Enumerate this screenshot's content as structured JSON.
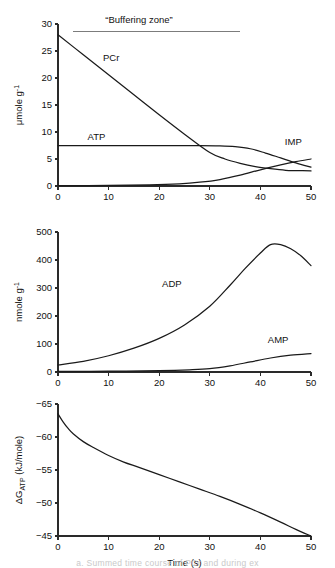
{
  "figure": {
    "xlabel": "Time (s)",
    "caption_partial": "a.  Summed time course of PCr and during ex"
  },
  "chart_data": [
    {
      "type": "line",
      "panel": "top",
      "title": "",
      "xlabel": "",
      "ylabel": "μmole g",
      "ylabel_sup": "-1",
      "xlim": [
        0,
        50
      ],
      "ylim": [
        0,
        30
      ],
      "xticks": [
        0,
        10,
        20,
        30,
        40,
        50
      ],
      "yticks": [
        0,
        5,
        10,
        15,
        20,
        25,
        30
      ],
      "grid": false,
      "legend": "inline-labels",
      "annotations": [
        {
          "text": "“Buffering zone”",
          "x": 16,
          "y": 30.2,
          "line_x0": 3,
          "line_x1": 36,
          "line_y": 28.6
        }
      ],
      "series": [
        {
          "name": "PCr",
          "label_x": 10.5,
          "label_y": 23.2,
          "x": [
            0,
            5,
            10,
            15,
            20,
            25,
            30,
            33,
            36,
            39,
            42,
            45,
            47,
            50
          ],
          "values": [
            28.0,
            24.3,
            20.6,
            16.9,
            13.2,
            9.6,
            6.2,
            5.0,
            4.2,
            3.6,
            3.2,
            2.9,
            2.85,
            2.8
          ]
        },
        {
          "name": "ATP",
          "label_x": 7.6,
          "label_y": 8.6,
          "x": [
            0,
            10,
            20,
            28,
            32,
            35,
            38,
            41,
            44,
            47,
            50
          ],
          "values": [
            7.5,
            7.5,
            7.5,
            7.5,
            7.45,
            7.3,
            6.9,
            6.1,
            5.2,
            4.3,
            3.5
          ]
        },
        {
          "name": "IMP",
          "label_x": 46.5,
          "label_y": 7.6,
          "x": [
            0,
            10,
            18,
            24,
            28,
            32,
            36,
            40,
            44,
            47,
            50
          ],
          "values": [
            0.05,
            0.1,
            0.2,
            0.4,
            0.7,
            1.2,
            2.0,
            3.0,
            3.9,
            4.5,
            5.0
          ]
        }
      ]
    },
    {
      "type": "line",
      "panel": "middle",
      "title": "",
      "xlabel": "",
      "ylabel": "nmole g",
      "ylabel_sup": "-1",
      "xlim": [
        0,
        50
      ],
      "ylim": [
        0,
        500
      ],
      "xticks": [
        0,
        10,
        20,
        30,
        40,
        50
      ],
      "yticks": [
        0,
        100,
        200,
        300,
        400,
        500
      ],
      "grid": false,
      "legend": "inline-labels",
      "annotations": [],
      "series": [
        {
          "name": "ADP",
          "label_x": 22.5,
          "label_y": 305,
          "x": [
            0,
            5,
            10,
            15,
            20,
            25,
            30,
            34,
            37,
            40,
            42,
            44,
            46,
            48,
            50
          ],
          "values": [
            25,
            38,
            58,
            85,
            120,
            168,
            235,
            310,
            370,
            425,
            455,
            455,
            440,
            415,
            380
          ]
        },
        {
          "name": "AMP",
          "label_x": 43.5,
          "label_y": 105,
          "x": [
            0,
            10,
            20,
            26,
            30,
            34,
            38,
            42,
            46,
            50
          ],
          "values": [
            2,
            3,
            5,
            8,
            12,
            22,
            36,
            50,
            60,
            66
          ]
        }
      ]
    },
    {
      "type": "line",
      "panel": "bottom",
      "title": "",
      "xlabel": "Time (s)",
      "ylabel": "ΔG",
      "ylabel_sub": "ATP",
      "ylabel_unit": " (kJ/mole)",
      "xlim": [
        0,
        50
      ],
      "ylim": [
        -65,
        -45
      ],
      "yaxis_inverted": true,
      "xticks": [
        0,
        10,
        20,
        30,
        40,
        50
      ],
      "yticks": [
        -65,
        -60,
        -55,
        -50,
        -45
      ],
      "grid": false,
      "legend": "none",
      "annotations": [],
      "series": [
        {
          "name": "dG_ATP",
          "label_x": null,
          "label_y": null,
          "x": [
            0,
            1,
            2,
            3,
            5,
            7,
            10,
            13,
            16,
            20,
            24,
            28,
            32,
            36,
            40,
            44,
            47,
            50
          ],
          "values": [
            -63.5,
            -62.3,
            -61.3,
            -60.5,
            -59.3,
            -58.4,
            -57.2,
            -56.2,
            -55.4,
            -54.3,
            -53.2,
            -52.1,
            -51.0,
            -49.8,
            -48.5,
            -47.1,
            -46.0,
            -45.0
          ]
        }
      ]
    }
  ]
}
